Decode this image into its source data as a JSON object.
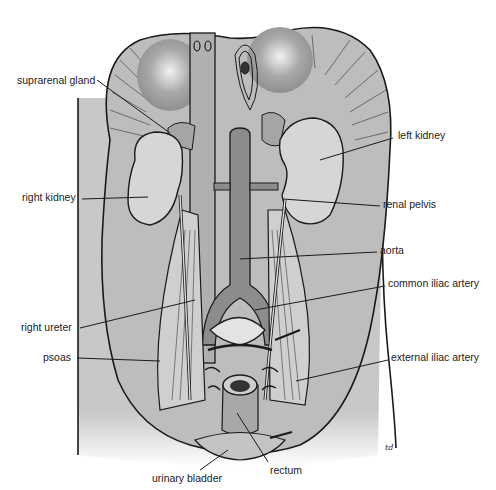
{
  "figure": {
    "signature": "td",
    "colors": {
      "background": "#ffffff",
      "body_fill": "#c8c8c8",
      "organ_fill": "#d6d6d6",
      "vessel_fill": "#8c8c8c",
      "outline": "#1a1a1a"
    }
  },
  "labels": [
    {
      "id": "suprarenal-gland",
      "text": "suprarenal gland",
      "x": 17,
      "y": 78,
      "anchor": "start",
      "tip": [
        170,
        133
      ]
    },
    {
      "id": "left-kidney",
      "text": "left kidney",
      "x": 398,
      "y": 133,
      "anchor": "start",
      "tip": [
        320,
        160
      ]
    },
    {
      "id": "right-kidney",
      "text": "right kidney",
      "x": 22,
      "y": 195,
      "anchor": "start",
      "tip": [
        148,
        197
      ]
    },
    {
      "id": "renal-pelvis",
      "text": "renal pelvis",
      "x": 383,
      "y": 202,
      "anchor": "start",
      "tip": [
        283,
        199
      ]
    },
    {
      "id": "aorta",
      "text": "aorta",
      "x": 380,
      "y": 248,
      "anchor": "start",
      "tip": [
        240,
        259
      ]
    },
    {
      "id": "common-iliac-artery",
      "text": "common iliac artery",
      "x": 388,
      "y": 281,
      "anchor": "start",
      "tip": [
        255,
        310
      ]
    },
    {
      "id": "right-ureter",
      "text": "right ureter",
      "x": 21,
      "y": 325,
      "anchor": "start",
      "tip": [
        195,
        300
      ]
    },
    {
      "id": "psoas",
      "text": "psoas",
      "x": 43,
      "y": 355,
      "anchor": "start",
      "tip": [
        160,
        361
      ]
    },
    {
      "id": "external-iliac-artery",
      "text": "external iliac artery",
      "x": 391,
      "y": 355,
      "anchor": "start",
      "tip": [
        296,
        381
      ]
    },
    {
      "id": "urinary-bladder",
      "text": "urinary bladder",
      "x": 152,
      "y": 476,
      "anchor": "start",
      "tip": [
        228,
        450
      ]
    },
    {
      "id": "rectum",
      "text": "rectum",
      "x": 270,
      "y": 468,
      "anchor": "start",
      "tip": [
        237,
        413
      ]
    }
  ]
}
